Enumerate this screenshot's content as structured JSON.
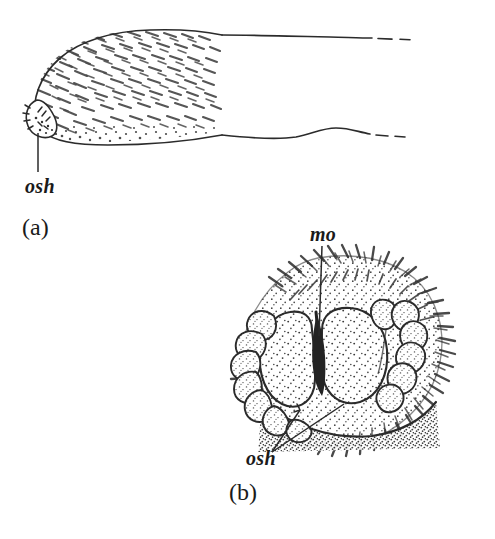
{
  "figure": {
    "type": "scientific-line-drawing",
    "background_color": "#ffffff",
    "ink_color": "#2b2b2b",
    "width": 495,
    "height": 539,
    "panels": [
      {
        "id": "a",
        "panel_label": "(a)",
        "subject": "lateral view of elongate appendage / tarsus with dense setal vestiture, tip at left, shaft truncated at right",
        "callouts": [
          {
            "label": "osh",
            "meaning": "osh",
            "leader": "single vertical line from label up to the rounded apical tip structure"
          }
        ]
      },
      {
        "id": "b",
        "panel_label": "(b)",
        "subject": "frontal/anterior view of head showing paired stippled compound eyes, median ocellar groove, lateral fans of lobed appendages, and dense radiating setal fringe",
        "callouts": [
          {
            "label": "mo",
            "meaning": "mo",
            "leader": "single vertical line descending from label into the median groove between the eyes"
          },
          {
            "label": "osh",
            "meaning": "osh",
            "leader": "two diverging lines from label up-right to points on the left and right eye margins"
          }
        ]
      }
    ]
  },
  "labels": {
    "osh_a": "osh",
    "panel_a": "(a)",
    "mo": "mo",
    "osh_b": "osh",
    "panel_b": "(b)"
  }
}
